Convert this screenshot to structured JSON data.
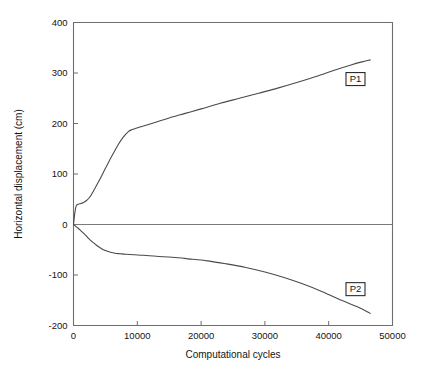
{
  "chart_data": {
    "type": "line",
    "title": "",
    "xlabel": "Computational cycles",
    "ylabel": "Horizontal displacement (cm)",
    "xlim": [
      0,
      50000
    ],
    "ylim": [
      -200,
      400
    ],
    "xticks": [
      0,
      10000,
      20000,
      30000,
      40000,
      50000
    ],
    "xtick_labels": [
      "0",
      "10000",
      "20000",
      "30000",
      "40000",
      "50000"
    ],
    "yticks": [
      -200,
      -100,
      0,
      100,
      200,
      300,
      400
    ],
    "ytick_labels": [
      "-200",
      "-100",
      "0",
      "100",
      "200",
      "300",
      "400"
    ],
    "grid": false,
    "legend_position": "inline-annotation",
    "zero_line": true,
    "line_color": "#4a4a4a",
    "frame_color": "#6e6e6e",
    "series": [
      {
        "name": "P1",
        "label": "P1",
        "label_x": 44200,
        "label_y": 288,
        "x": [
          0,
          200,
          400,
          700,
          1000,
          1500,
          2000,
          2600,
          3200,
          3900,
          4600,
          5400,
          6200,
          7000,
          7800,
          8600,
          9200,
          9700,
          10400,
          11500,
          13000,
          15000,
          17500,
          20000,
          23000,
          26000,
          29000,
          32000,
          35000,
          38000,
          41000,
          43500,
          45200,
          46500
        ],
        "y": [
          0,
          22,
          36,
          40,
          41,
          43,
          47,
          55,
          68,
          84,
          101,
          121,
          140,
          158,
          173,
          184,
          188,
          190,
          193,
          197,
          203,
          211,
          220,
          229,
          240,
          250,
          260,
          270,
          281,
          293,
          306,
          316,
          322,
          326
        ]
      },
      {
        "name": "P2",
        "label": "P2",
        "label_x": 44200,
        "label_y": -128,
        "x": [
          0,
          300,
          700,
          1200,
          1800,
          2400,
          3000,
          3700,
          4400,
          5100,
          5800,
          6500,
          7300,
          8200,
          9500,
          11000,
          13000,
          15500,
          18000,
          21000,
          24000,
          27000,
          30000,
          33000,
          36000,
          39000,
          42000,
          44500,
          46500
        ],
        "y": [
          0,
          -3,
          -7,
          -13,
          -20,
          -28,
          -35,
          -42,
          -48,
          -52,
          -55,
          -57,
          -58,
          -59,
          -60,
          -61,
          -63,
          -65,
          -68,
          -72,
          -78,
          -85,
          -94,
          -105,
          -118,
          -133,
          -150,
          -163,
          -176
        ]
      }
    ]
  },
  "icons": {
    "series_marker": "line-series-icon"
  }
}
